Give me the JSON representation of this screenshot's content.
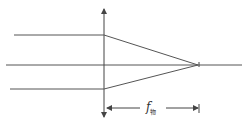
{
  "diagram": {
    "type": "convex-lens-ray-diagram",
    "stroke_color": "#555555",
    "focal_length_label": {
      "symbol": "f",
      "subscript": "物"
    },
    "elements": {
      "optical_axis": {
        "x1": 6,
        "y": 65,
        "x2": 242
      },
      "lens": {
        "x": 104,
        "y_top": 8,
        "y_bottom": 117
      },
      "incoming_rays": [
        {
          "x_start": 14,
          "y": 35
        },
        {
          "x_start": 6,
          "y": 65
        },
        {
          "x_start": 10,
          "y": 89
        }
      ],
      "focal_point": {
        "x": 198,
        "y": 65
      },
      "dimension_line": {
        "y": 108,
        "x_start": 106,
        "x_end": 198
      }
    }
  }
}
